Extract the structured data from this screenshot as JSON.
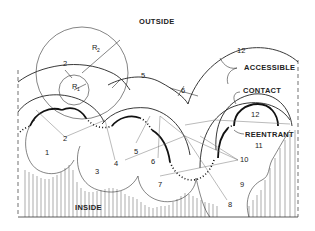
{
  "figure": {
    "region_labels": {
      "outside": "OUTSIDE",
      "inside": "INSIDE"
    },
    "surface_labels": {
      "accessible": "ACCESSIBLE",
      "contact": "CONTACT",
      "reentrant": "REENTRANT"
    },
    "radius_labels": {
      "r1": "R",
      "r1_sub": "1",
      "r2": "R",
      "r2_sub": "2"
    },
    "atom_labels": [
      "1",
      "2",
      "3",
      "4",
      "5",
      "6",
      "7",
      "8",
      "9",
      "10",
      "11",
      "12"
    ],
    "probe_labels": {
      "p2": "2",
      "p5": "5",
      "p6": "6",
      "p12_outer": "12",
      "p12_inner": "12"
    }
  }
}
